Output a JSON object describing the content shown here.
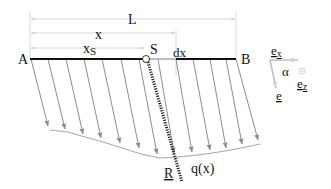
{
  "diagram": {
    "labels": {
      "L": "L",
      "x": "x",
      "xS_main": "x",
      "xS_sub": "S",
      "A": "A",
      "S": "S",
      "B": "B",
      "dx": "dx",
      "ex_main": "e",
      "ex_sub": "x",
      "ez_main": "e",
      "ez_sub": "z",
      "e": "e",
      "alpha": "α",
      "R": "R",
      "q": "q(x)"
    },
    "colors": {
      "beam": "#111111",
      "load_arrows": "#8c8c8c",
      "dimension_lines": "#c8c8c8",
      "resultant": "#222222",
      "text": "#111111"
    },
    "load_arrows_count": 14
  }
}
